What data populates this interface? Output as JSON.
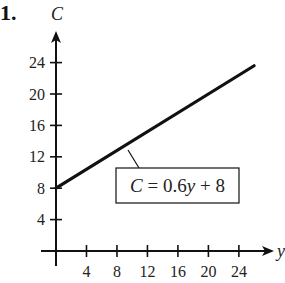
{
  "problem_number": "1.",
  "chart_data": {
    "type": "line",
    "title": "",
    "xlabel": "y",
    "ylabel": "C",
    "xlim": [
      0,
      26
    ],
    "ylim": [
      0,
      28
    ],
    "x_ticks": [
      4,
      8,
      12,
      16,
      20,
      24
    ],
    "y_ticks": [
      4,
      8,
      12,
      16,
      20,
      24
    ],
    "grid": false,
    "series": [
      {
        "name": "C = 0.6y + 8",
        "x": [
          0,
          26
        ],
        "values": [
          8,
          23.6
        ]
      }
    ],
    "annotations": [
      {
        "text": "C = 0.6y + 8",
        "boxed": true,
        "points_to": [
          10,
          14
        ]
      }
    ],
    "legend": "none"
  },
  "labels": {
    "x_var": "y",
    "y_var": "C",
    "equation_lhs": "C",
    "equation_rhs": " = 0.6",
    "equation_var": "y",
    "equation_tail": " + 8"
  },
  "colors": {
    "line": "#111111",
    "axis": "#111111",
    "text": "#222222",
    "background": "#ffffff"
  }
}
